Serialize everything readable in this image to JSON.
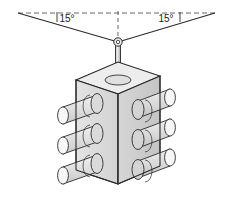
{
  "figure": {
    "background_color": "#ffffff",
    "line_color": "#2b2b2b",
    "dimension_line_color": "#555555"
  },
  "annotations": {
    "angle_left": {
      "label": "15°",
      "value": 15,
      "unit": "degree",
      "x": 67,
      "y": 19
    },
    "angle_right": {
      "label": "15°",
      "value": 15,
      "unit": "degree",
      "x": 166,
      "y": 19
    }
  },
  "reference_geometry": {
    "pivot": {
      "x": 118,
      "y": 42
    },
    "horizontal_dashed_line": {
      "x1": 18,
      "y1": 13,
      "x2": 215,
      "y2": 13
    },
    "vertical_dashed_centerline": {
      "x1": 118,
      "y1": 11,
      "x2": 118,
      "y2": 42
    },
    "swing_line_left": {
      "x1": 18,
      "y1": 13,
      "x2": 118,
      "y2": 42
    },
    "swing_line_right": {
      "x1": 215,
      "y1": 13,
      "x2": 118,
      "y2": 42
    },
    "tick_left": {
      "x": 57,
      "y1": 12,
      "y2": 22
    },
    "tick_right": {
      "x": 180,
      "y1": 12,
      "y2": 22
    }
  },
  "components": {
    "eyelet": {
      "name": "suspension-eyelet",
      "cx": 118,
      "cy": 42,
      "r": 4
    },
    "rod": {
      "name": "suspension-rod",
      "top_y": 44,
      "bottom_y": 80,
      "width": 5
    },
    "collar": {
      "name": "rod-collar-washer",
      "cx": 118,
      "cy": 80,
      "rx": 11,
      "ry": 4
    },
    "box": {
      "name": "junction-box",
      "face_left_fill": "#dcdcdc",
      "face_right_fill": "#cfcfcf",
      "face_top_fill": "#ededed",
      "port_fill": "#e6e6e6",
      "port_end_fill": "#f5f5f5"
    }
  },
  "ports": {
    "count_per_face": 3,
    "total": 6,
    "left_face": [
      {
        "label": "port-left-upper",
        "index": 1
      },
      {
        "label": "port-left-middle",
        "index": 2
      },
      {
        "label": "port-left-lower",
        "index": 3
      }
    ],
    "right_face": [
      {
        "label": "port-right-upper",
        "index": 1
      },
      {
        "label": "port-right-middle",
        "index": 2
      },
      {
        "label": "port-right-lower",
        "index": 3
      }
    ]
  }
}
